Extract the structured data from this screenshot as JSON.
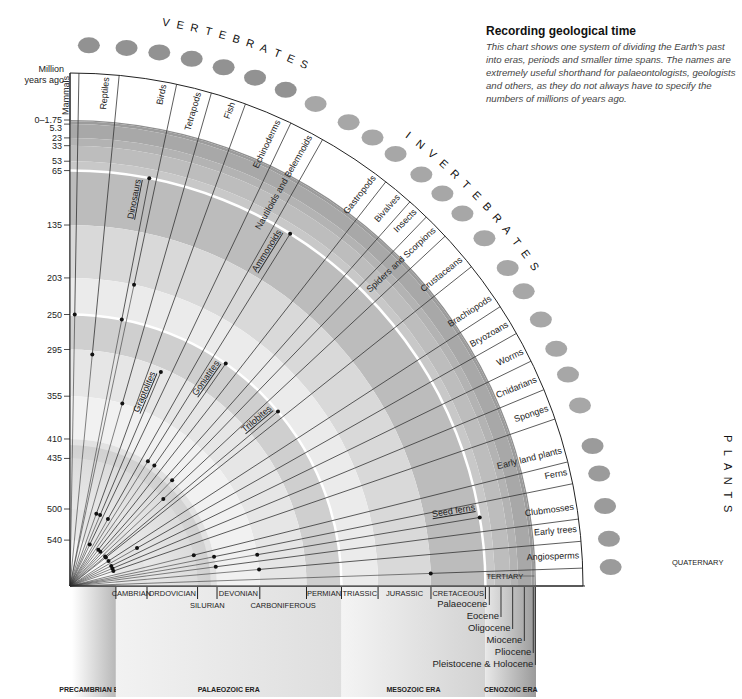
{
  "intro": {
    "title": "Recording geological time",
    "body": "This chart shows one system of dividing the Earth's past into eras, periods and smaller time spans. The names are extremely useful shorthand for palaeontologists, geologists and others, as they do not always have to specify the numbers of millions of years ago."
  },
  "sections": {
    "vertebrates": "VERTEBRATES",
    "invertebrates": "INVERTEBRATES",
    "plants": "PLANTS"
  },
  "chart_data": {
    "type": "radial-timeline",
    "title": "Recording geological time",
    "ylabel": "Million years ago",
    "ylim": [
      0,
      590
    ],
    "ticks": [
      "0–1.75",
      "5.3",
      "23",
      "33",
      "53",
      "65",
      "135",
      "203",
      "250",
      "295",
      "355",
      "410",
      "435",
      "500",
      "540"
    ],
    "tick_values": [
      0,
      5.3,
      23,
      33,
      53,
      65,
      135,
      203,
      250,
      295,
      355,
      410,
      435,
      500,
      540
    ],
    "groups": [
      {
        "name": "Mammals",
        "category": "vertebrates",
        "origin_mya": 250,
        "angle": 89
      },
      {
        "name": "Reptiles",
        "category": "vertebrates",
        "origin_mya": 300,
        "angle": 84.5
      },
      {
        "name": "Dinosaurs",
        "category": "vertebrates",
        "origin_mya": 250,
        "end_mya": 65,
        "angle": 79,
        "inner": true
      },
      {
        "name": "Birds",
        "category": "vertebrates",
        "origin_mya": 203,
        "angle": 78
      },
      {
        "name": "Tetrapods",
        "category": "vertebrates",
        "origin_mya": 355,
        "angle": 74
      },
      {
        "name": "Fish",
        "category": "vertebrates",
        "origin_mya": 500,
        "angle": 70
      },
      {
        "name": "Graptolites",
        "category": "invertebrates",
        "origin_mya": 500,
        "end_mya": 300,
        "angle": 67,
        "inner": true
      },
      {
        "name": "Echinoderms",
        "category": "invertebrates",
        "origin_mya": 540,
        "angle": 64.5
      },
      {
        "name": "Nautiloids and Belemnoids",
        "category": "invertebrates",
        "origin_mya": 500,
        "angle": 60.5
      },
      {
        "name": "Ammonoids",
        "category": "invertebrates",
        "origin_mya": 410,
        "end_mya": 65,
        "angle": 58,
        "inner": true
      },
      {
        "name": "Goniatites",
        "category": "invertebrates",
        "origin_mya": 410,
        "end_mya": 250,
        "angle": 55,
        "inner": true
      },
      {
        "name": "Gastropods",
        "category": "invertebrates",
        "origin_mya": 540,
        "angle": 52
      },
      {
        "name": "Bivalves",
        "category": "invertebrates",
        "origin_mya": 540,
        "angle": 48.5
      },
      {
        "name": "Insects",
        "category": "invertebrates",
        "origin_mya": 410,
        "angle": 46
      },
      {
        "name": "Spiders and Scorpions",
        "category": "invertebrates",
        "origin_mya": 435,
        "angle": 43
      },
      {
        "name": "Trilobites",
        "category": "invertebrates",
        "origin_mya": 540,
        "end_mya": 250,
        "angle": 40,
        "inner": true
      },
      {
        "name": "Crustaceans",
        "category": "invertebrates",
        "origin_mya": 540,
        "angle": 38.5
      },
      {
        "name": "Brachiopods",
        "category": "invertebrates",
        "origin_mya": 540,
        "angle": 33
      },
      {
        "name": "Bryozoans",
        "category": "invertebrates",
        "origin_mya": 500,
        "angle": 29.5
      },
      {
        "name": "Worms",
        "category": "invertebrates",
        "origin_mya": 540,
        "angle": 26
      },
      {
        "name": "Cnidarians",
        "category": "invertebrates",
        "origin_mya": 540,
        "angle": 22.5
      },
      {
        "name": "Sponges",
        "category": "invertebrates",
        "origin_mya": 540,
        "angle": 19
      },
      {
        "name": "Early land plants",
        "category": "plants",
        "origin_mya": 435,
        "angle": 14
      },
      {
        "name": "Ferns",
        "category": "plants",
        "origin_mya": 410,
        "angle": 11.5
      },
      {
        "name": "Seed ferns",
        "category": "plants",
        "origin_mya": 355,
        "end_mya": 65,
        "angle": 9.5,
        "inner": true
      },
      {
        "name": "Clubmosses",
        "category": "plants",
        "origin_mya": 410,
        "angle": 7.5
      },
      {
        "name": "Early trees",
        "category": "plants",
        "origin_mya": 355,
        "angle": 5
      },
      {
        "name": "Angiosperms",
        "category": "plants",
        "origin_mya": 135,
        "angle": 2
      }
    ],
    "periods": [
      "CAMBRIAN",
      "ORDOVICIAN",
      "SILURIAN",
      "DEVONIAN",
      "CARBONIFEROUS",
      "PERMIAN",
      "TRIASSIC",
      "JURASSIC",
      "CRETACEOUS",
      "TERTIARY",
      "QUATERNARY"
    ],
    "epochs": [
      "Palaeocene",
      "Eocene",
      "Oligocene",
      "Miocene",
      "Pliocene",
      "Pleistocene & Holocene"
    ],
    "eras": [
      "PRECAMBRIAN ERA",
      "PALAEOZOIC ERA",
      "MESOZOIC ERA",
      "CENOZOIC ERA"
    ]
  },
  "axis": {
    "label_line1": "Million",
    "label_line2": "years ago"
  }
}
